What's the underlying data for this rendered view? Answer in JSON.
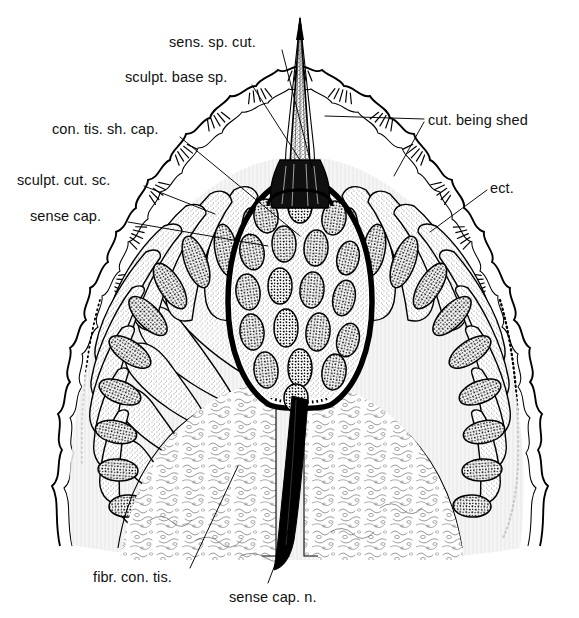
{
  "figure": {
    "kind": "histological-section-diagram",
    "background_color": "#ffffff",
    "ink_color": "#000000",
    "width": 579,
    "height": 618
  },
  "labels": [
    {
      "id": "sens-sp-cut",
      "text": "sens. sp. cut.",
      "x": 169,
      "y": 35,
      "leader": {
        "from_x": 282,
        "from_y": 50,
        "to_x": 312,
        "to_y": 168
      }
    },
    {
      "id": "sculpt-base-sp",
      "text": "sculpt. base sp.",
      "x": 125,
      "y": 70,
      "leader": {
        "from_x": 252,
        "from_y": 85,
        "to_x": 300,
        "to_y": 160
      }
    },
    {
      "id": "con-tis-sh-cap",
      "text": "con. tis. sh. cap.",
      "x": 52,
      "y": 122,
      "leader": {
        "from_x": 180,
        "from_y": 137,
        "to_x": 300,
        "to_y": 236
      }
    },
    {
      "id": "sculpt-cut-sc",
      "text": "sculpt. cut. sc.",
      "x": 17,
      "y": 173,
      "leader": {
        "from_x": 144,
        "from_y": 186,
        "to_x": 215,
        "to_y": 214
      }
    },
    {
      "id": "sense-cap",
      "text": "sense cap.",
      "x": 30,
      "y": 209,
      "leader": {
        "from_x": 128,
        "from_y": 222,
        "to_x": 268,
        "to_y": 246
      }
    },
    {
      "id": "cut-being-shed",
      "text": "cut. being shed",
      "x": 428,
      "y": 113,
      "leader": {
        "from_x": 424,
        "from_y": 119,
        "to_x": 325,
        "to_y": 116
      }
    },
    {
      "id": "ect",
      "text": "ect.",
      "x": 490,
      "y": 181,
      "leader": {
        "from_x": 487,
        "from_y": 190,
        "to_x": 430,
        "to_y": 232
      }
    },
    {
      "id": "fibr-con-tis",
      "text": "fibr. con. tis.",
      "x": 93,
      "y": 570,
      "leader": {
        "from_x": 190,
        "from_y": 568,
        "to_x": 238,
        "to_y": 466
      }
    },
    {
      "id": "sense-cap-n",
      "text": "sense cap. n.",
      "x": 229,
      "y": 590,
      "leader": {
        "from_x": 268,
        "from_y": 583,
        "to_x": 292,
        "to_y": 520
      }
    }
  ],
  "structures": {
    "spine": "sensory spine projecting above the cuticle",
    "spine_base": "sculptured dark base of spine",
    "capsule": "ovoid sense capsule packed with nucleated cells",
    "epidermis": "radiating columnar ectodermal cells with oval nuclei",
    "cuticle": "scalloped outer cuticle with hatched tufts",
    "connective": "fibrous connective tissue mass below the capsule",
    "nerve": "dark sense capsule nerve running downward"
  }
}
